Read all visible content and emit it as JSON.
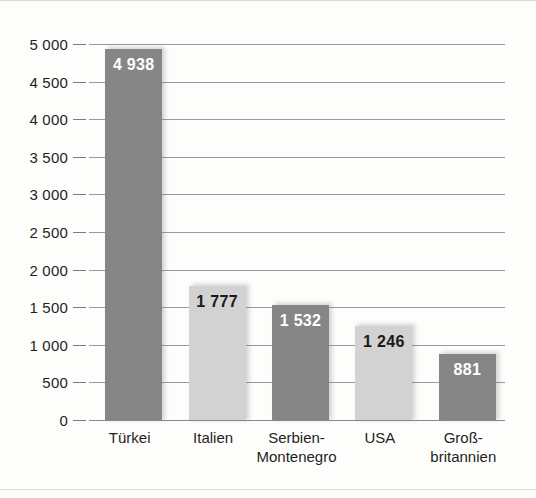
{
  "chart_data": {
    "type": "bar",
    "title": "",
    "subtitle": "",
    "xlabel": "",
    "ylabel": "",
    "categories": [
      "Türkei",
      "Italien",
      "Serbien-\nMontenegro",
      "USA",
      "Groß-\nbritannien"
    ],
    "values": [
      4938,
      1777,
      1532,
      1246,
      881
    ],
    "value_labels": [
      "4 938",
      "1 777",
      "1 532",
      "1 246",
      "881"
    ],
    "bar_styles": [
      "dark",
      "light",
      "dark",
      "light",
      "dark"
    ],
    "ylim": [
      0,
      5000
    ],
    "ytick_values": [
      0,
      500,
      1000,
      1500,
      2000,
      2500,
      3000,
      3500,
      4000,
      4500,
      5000
    ],
    "ytick_labels": [
      "0",
      "500",
      "1 000",
      "1 500",
      "2 000",
      "2 500",
      "3 000",
      "3 500",
      "4 000",
      "4 500",
      "5 000"
    ],
    "grid": true,
    "legend": null,
    "colors": {
      "bar_dark": "#868686",
      "bar_light": "#d2d2d2",
      "gridline": "#9a9a9a",
      "text": "#1f1f1f",
      "value_on_dark": "#ffffff",
      "value_on_light": "#1a1a1a",
      "background": "#fdfdfb"
    }
  }
}
